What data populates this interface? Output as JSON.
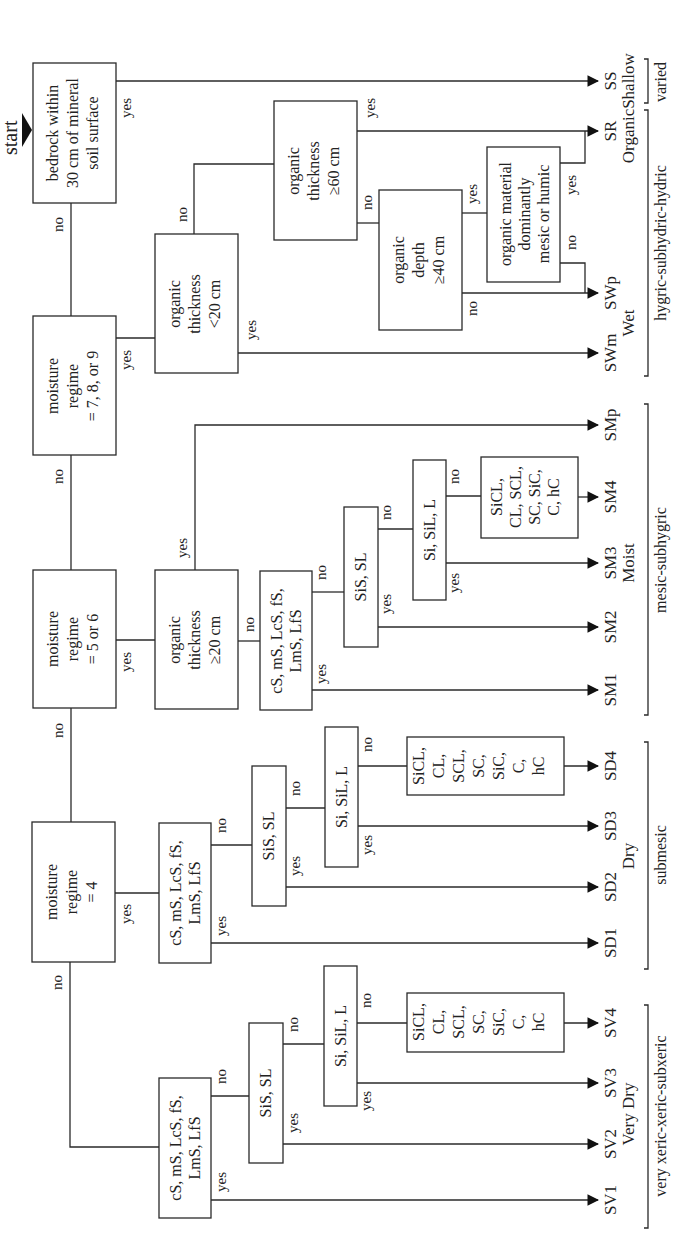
{
  "start_label": "start",
  "decisions": {
    "bedrock": [
      "bedrock within",
      "30 cm of mineral",
      "soil surface"
    ],
    "moisture_789": [
      "moisture",
      "regime",
      "= 7, 8, or 9"
    ],
    "moisture_56": [
      "moisture",
      "regime",
      "= 5 or 6"
    ],
    "moisture_4": [
      "moisture",
      "regime",
      "= 4"
    ],
    "org_lt20": [
      "organic",
      "thickness",
      "<20 cm"
    ],
    "org_ge60": [
      "organic",
      "thickness",
      "≥60 cm"
    ],
    "org_depth40": [
      "organic",
      "depth",
      "≥40 cm"
    ],
    "org_material": [
      "organic material",
      "dominantly",
      "mesic or humic"
    ],
    "org_ge20": [
      "organic",
      "thickness",
      "≥20 cm"
    ],
    "sand_m": [
      "cS, mS, LcS, fS,",
      "LmS, LfS"
    ],
    "sis_m": [
      "SiS, SL"
    ],
    "si_m": [
      "Si, SiL, L"
    ],
    "clay_m": [
      "SiCL,",
      "CL, SCL,",
      "SC, SiC,",
      "C, hC"
    ],
    "sand_d": [
      "cS, mS, LcS, fS,",
      "LmS, LfS"
    ],
    "sis_d": [
      "SiS, SL"
    ],
    "si_d": [
      "Si, SiL, L"
    ],
    "clay_d": [
      "SiCL,",
      "CL,",
      "SCL,",
      "SC,",
      "SiC,",
      "C,",
      "hC"
    ],
    "sand_v": [
      "cS, mS, LcS, fS,",
      "LmS, LfS"
    ],
    "sis_v": [
      "SiS, SL"
    ],
    "si_v": [
      "Si, SiL, L"
    ],
    "clay_v": [
      "SiCL,",
      "CL,",
      "SCL,",
      "SC,",
      "SiC,",
      "C,",
      "hC"
    ]
  },
  "branch_labels": {
    "yes": "yes",
    "no": "no"
  },
  "outcomes": {
    "SS": "SS",
    "SR": "SR",
    "SWp": "SWp",
    "SWm": "SWm",
    "SMp": "SMp",
    "SM4": "SM4",
    "SM3": "SM3",
    "SM2": "SM2",
    "SM1": "SM1",
    "SD4": "SD4",
    "SD3": "SD3",
    "SD2": "SD2",
    "SD1": "SD1",
    "SV4": "SV4",
    "SV3": "SV3",
    "SV2": "SV2",
    "SV1": "SV1"
  },
  "class_names": {
    "shallow": "Shallow",
    "organic": "Organic",
    "wet": "Wet",
    "moist": "Moist",
    "dry": "Dry",
    "very_dry": "Very Dry"
  },
  "groups": {
    "varied": "varied",
    "hygric": "hygric-subhydric-hydric",
    "mesic": "mesic-subhygric",
    "submesic": "submesic",
    "xeric": "very xeric-xeric-subxeric"
  }
}
